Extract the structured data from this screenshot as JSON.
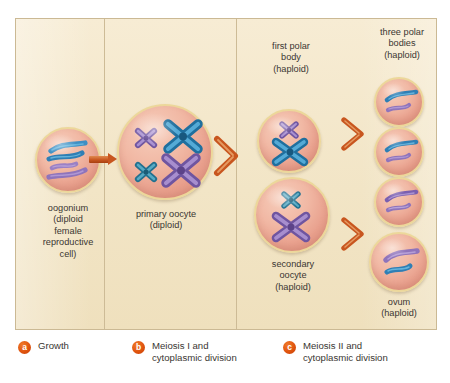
{
  "figure": {
    "background_color": "#f4e8cc",
    "panel_border_color": "#cbb994",
    "accent_color": "#c8561f",
    "badge_color": "#e0540e",
    "cell_membrane_color": "#ecd79a",
    "cytoplasm_color": "#f1b8a4",
    "chromosome_blue": "#3e8fc4",
    "chromosome_purple": "#8f74bb"
  },
  "stages": [
    {
      "id": "oogonium",
      "caption": "oogonium\n(diploid\nfemale\nreproductive\ncell)",
      "ploidy": "diploid",
      "chromosome_form": "uncondensed threads",
      "chromosome_count_shown": 4
    },
    {
      "id": "primary-oocyte",
      "caption": "primary oocyte\n(diploid)",
      "ploidy": "diploid",
      "chromosome_form": "duplicated (X-shaped)",
      "chromosome_count_shown": 4
    },
    {
      "id": "first-polar-body",
      "caption": "first polar\nbody\n(haploid)",
      "ploidy": "haploid",
      "chromosome_form": "duplicated (X-shaped)",
      "chromosome_count_shown": 2
    },
    {
      "id": "secondary-oocyte",
      "caption": "secondary\noocyte\n(haploid)",
      "ploidy": "haploid",
      "chromosome_form": "duplicated (X-shaped)",
      "chromosome_count_shown": 2
    },
    {
      "id": "three-polar-bodies",
      "caption": "three polar\nbodies\n(haploid)",
      "ploidy": "haploid",
      "chromosome_form": "single chromatids",
      "chromosome_count_shown": 2
    },
    {
      "id": "ovum",
      "caption": "ovum\n(haploid)",
      "ploidy": "haploid",
      "chromosome_form": "single chromatids",
      "chromosome_count_shown": 2
    }
  ],
  "legend": {
    "items": [
      {
        "key": "a",
        "label": "Growth"
      },
      {
        "key": "b",
        "label": "Meiosis I and\ncytoplasmic division"
      },
      {
        "key": "c",
        "label": "Meiosis II and\ncytoplasmic division"
      }
    ]
  }
}
